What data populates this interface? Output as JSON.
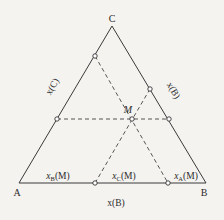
{
  "diagram": {
    "type": "ternary-phase-diagram",
    "vertices": {
      "A": {
        "label": "A"
      },
      "B": {
        "label": "B"
      },
      "C": {
        "label": "C"
      }
    },
    "axis_labels": {
      "left_side": "x(C)",
      "right_side": "x(B)",
      "bottom": "x(B)"
    },
    "point": {
      "label": "M"
    },
    "bottom_segments": {
      "left": {
        "main": "x",
        "sub": "B",
        "tail": "(M)"
      },
      "middle": {
        "main": "x",
        "sub": "C",
        "tail": "(M)"
      },
      "right": {
        "main": "x",
        "sub": "A",
        "tail": "(M)"
      }
    },
    "colors": {
      "line": "#3a3a3a",
      "dashed": "#555555",
      "background": "#f4f3f0"
    }
  }
}
